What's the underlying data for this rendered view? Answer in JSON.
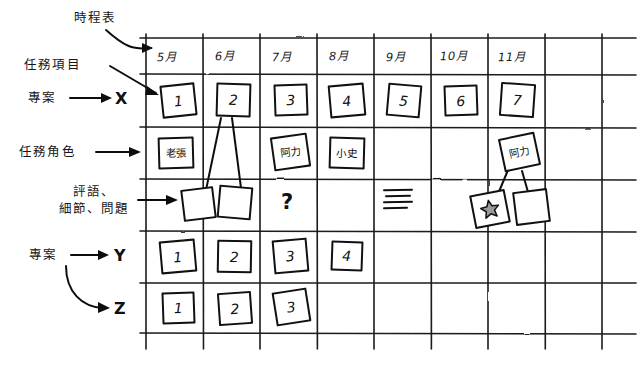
{
  "diagram": {
    "title_annotation": "時程表",
    "annotations": [
      {
        "name": "schedule",
        "text": "時程表"
      },
      {
        "name": "task-item",
        "text": "任務項目"
      },
      {
        "name": "task-role",
        "text": "任務角色"
      },
      {
        "name": "comments-details-questions",
        "text": "評語、\n細節、問題"
      },
      {
        "name": "project-x",
        "text": "專案"
      },
      {
        "name": "project-yz",
        "text": "專案"
      }
    ],
    "axis_letters": [
      "X",
      "Y",
      "Z"
    ],
    "columns": [
      {
        "label": "5月"
      },
      {
        "label": "6月"
      },
      {
        "label": "7月"
      },
      {
        "label": "8月"
      },
      {
        "label": "9月"
      },
      {
        "label": "10月"
      },
      {
        "label": "11月"
      },
      {
        "label": ""
      },
      {
        "label": ""
      }
    ],
    "rows": [
      {
        "key": "x-tasks",
        "axis": "X",
        "label": "任務項目"
      },
      {
        "key": "x-roles",
        "axis": "",
        "label": "任務角色"
      },
      {
        "key": "x-notes",
        "axis": "",
        "label": "評語、細節、問題"
      },
      {
        "key": "y-tasks",
        "axis": "Y",
        "label": "專案"
      },
      {
        "key": "z-tasks",
        "axis": "Z",
        "label": "專案"
      },
      {
        "key": "empty",
        "axis": "",
        "label": ""
      }
    ],
    "cells": {
      "x_tasks": [
        "1",
        "2",
        "3",
        "4",
        "5",
        "6",
        "7",
        "",
        ""
      ],
      "x_roles": [
        "老張",
        "",
        "阿力",
        "小史",
        "",
        "",
        "阿力",
        "",
        ""
      ],
      "y_tasks": [
        "1",
        "2",
        "3",
        "4",
        "",
        "",
        "",
        "",
        ""
      ],
      "z_tasks": [
        "1",
        "2",
        "3",
        "",
        "",
        "",
        "",
        "",
        ""
      ]
    },
    "note_row": {
      "pair_under_2": [
        "",
        ""
      ],
      "question_mark": "?",
      "text_lines_month": "9月",
      "text_lines_count": 4,
      "starred_note": "★",
      "plain_note": ""
    },
    "colors": {
      "ink": "#111111",
      "paper": "#ffffff",
      "star_fill": "#9a9a9a"
    }
  }
}
